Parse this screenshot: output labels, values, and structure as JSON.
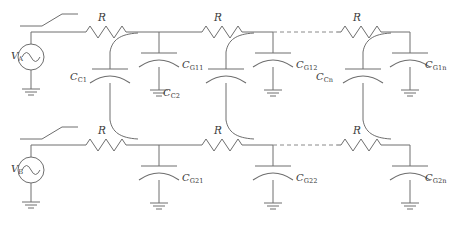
{
  "figure": {
    "type": "circuit-schematic",
    "background_color": "#ffffff",
    "line_color": "#6e6e6e",
    "text_color": "#3a3a3a"
  },
  "sources": [
    {
      "id": "source-a",
      "label": "V",
      "subscript": "A",
      "symbol": "ac-source-sine",
      "row": "top"
    },
    {
      "id": "source-b",
      "label": "V",
      "subscript": "B",
      "symbol": "ac-source-sine",
      "row": "bottom"
    }
  ],
  "switches": [
    {
      "id": "switch-a",
      "symbol": "spst-open-switch",
      "row": "top"
    },
    {
      "id": "switch-b",
      "symbol": "spst-open-switch",
      "row": "bottom"
    }
  ],
  "resistors": [
    {
      "id": "r-top-1",
      "label": "R",
      "row": "top",
      "stage": 1
    },
    {
      "id": "r-top-2",
      "label": "R",
      "row": "top",
      "stage": 2
    },
    {
      "id": "r-top-n",
      "label": "R",
      "row": "top",
      "stage": "n"
    },
    {
      "id": "r-bot-1",
      "label": "R",
      "row": "bottom",
      "stage": 1
    },
    {
      "id": "r-bot-2",
      "label": "R",
      "row": "bottom",
      "stage": 2
    },
    {
      "id": "r-bot-n",
      "label": "R",
      "row": "bottom",
      "stage": "n"
    }
  ],
  "coupling_capacitors": [
    {
      "id": "cap-cc1",
      "label": "C",
      "subscript": "C1",
      "subscript_base": "C",
      "subscript_index": "1",
      "stage": 1
    },
    {
      "id": "cap-cc2",
      "label": "C",
      "subscript": "C2",
      "subscript_base": "C",
      "subscript_index": "2",
      "stage": 2
    },
    {
      "id": "cap-ccn",
      "label": "C",
      "subscript": "Cn",
      "subscript_base": "C",
      "subscript_index": "n",
      "stage": "n"
    }
  ],
  "ground_capacitors": [
    {
      "id": "cap-cg11",
      "label": "C",
      "subscript_base": "G1",
      "subscript_index": "1",
      "row": "top",
      "stage": 1
    },
    {
      "id": "cap-cg12",
      "label": "C",
      "subscript_base": "G1",
      "subscript_index": "2",
      "row": "top",
      "stage": 2
    },
    {
      "id": "cap-cg1n",
      "label": "C",
      "subscript_base": "G1",
      "subscript_index": "n",
      "row": "top",
      "stage": "n"
    },
    {
      "id": "cap-cg21",
      "label": "C",
      "subscript_base": "G2",
      "subscript_index": "1",
      "row": "bottom",
      "stage": 1
    },
    {
      "id": "cap-cg22",
      "label": "C",
      "subscript_base": "G2",
      "subscript_index": "2",
      "row": "bottom",
      "stage": 2
    },
    {
      "id": "cap-cg2n",
      "label": "C",
      "subscript_base": "G2",
      "subscript_index": "n",
      "row": "bottom",
      "stage": "n"
    }
  ],
  "grounds": [
    {
      "id": "gnd-source-a"
    },
    {
      "id": "gnd-source-b"
    },
    {
      "id": "gnd-cg11"
    },
    {
      "id": "gnd-cg12"
    },
    {
      "id": "gnd-cg1n"
    },
    {
      "id": "gnd-cg21"
    },
    {
      "id": "gnd-cg22"
    },
    {
      "id": "gnd-cg2n"
    }
  ],
  "ellipsis": {
    "top": "dashed-continuation",
    "bottom": "dashed-continuation"
  },
  "labels": {
    "v_a": "V",
    "v_a_sub": "A",
    "v_b": "V",
    "v_b_sub": "B",
    "r": "R",
    "c": "C",
    "cc1_sub_base": "C",
    "cc1_sub_idx": "1",
    "cc2_sub_base": "C",
    "cc2_sub_idx": "2",
    "ccn_sub_base": "C",
    "ccn_sub_idx": "n",
    "cg11_sub_base": "G1",
    "cg11_sub_idx": "1",
    "cg12_sub_base": "G1",
    "cg12_sub_idx": "2",
    "cg1n_sub_base": "G1",
    "cg1n_sub_idx": "n",
    "cg21_sub_base": "G2",
    "cg21_sub_idx": "1",
    "cg22_sub_base": "G2",
    "cg22_sub_idx": "2",
    "cg2n_sub_base": "G2",
    "cg2n_sub_idx": "n"
  }
}
